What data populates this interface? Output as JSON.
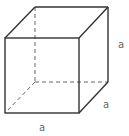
{
  "diagram": {
    "type": "cube",
    "stroke_color": "#333333",
    "hidden_stroke_color": "#666666",
    "label_color": "#666666",
    "labels": {
      "height": "a",
      "depth": "a",
      "width": "a"
    }
  }
}
